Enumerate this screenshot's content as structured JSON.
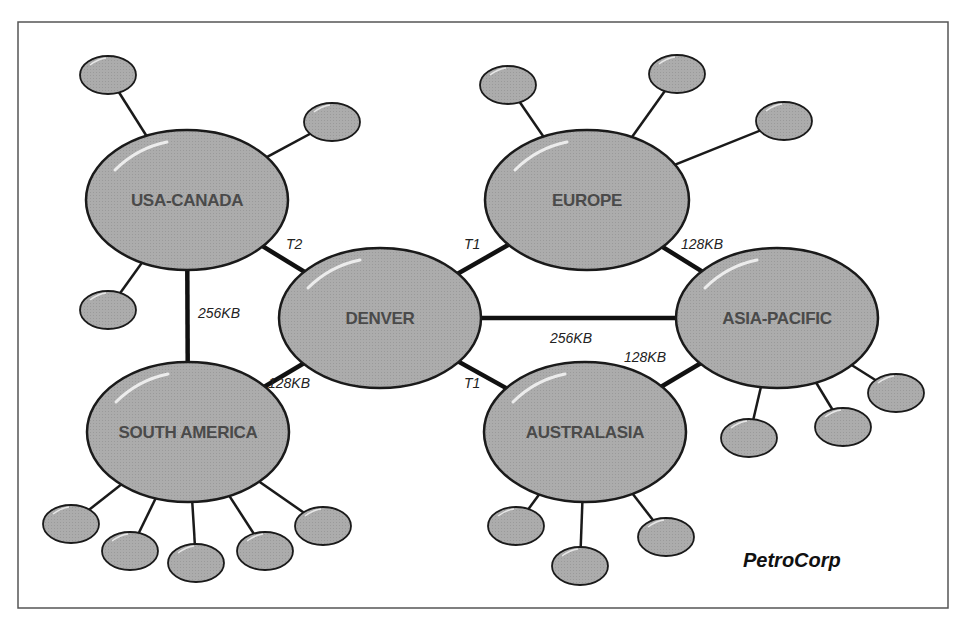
{
  "diagram": {
    "brand": "PetroCorp",
    "colors": {
      "node_fill": "#a9a9a9",
      "node_stroke": "#1a1a1a",
      "label_text": "#4a4a4a",
      "background": "#ffffff",
      "frame": "#555555"
    },
    "hubs": [
      {
        "id": "usa-canada",
        "label": "USA-CANADA",
        "cx": 187,
        "cy": 200,
        "rx": 101,
        "ry": 70
      },
      {
        "id": "denver",
        "label": "DENVER",
        "cx": 380,
        "cy": 318,
        "rx": 101,
        "ry": 70
      },
      {
        "id": "europe",
        "label": "EUROPE",
        "cx": 587,
        "cy": 200,
        "rx": 102,
        "ry": 70
      },
      {
        "id": "asia-pacific",
        "label": "ASIA-PACIFIC",
        "cx": 777,
        "cy": 318,
        "rx": 101,
        "ry": 70
      },
      {
        "id": "south-america",
        "label": "SOUTH AMERICA",
        "cx": 188,
        "cy": 432,
        "rx": 101,
        "ry": 70
      },
      {
        "id": "australasia",
        "label": "AUSTRALASIA",
        "cx": 585,
        "cy": 432,
        "rx": 101,
        "ry": 70
      }
    ],
    "links": [
      {
        "from": "usa-canada",
        "to": "denver",
        "label": "T2",
        "lx": 286,
        "ly": 249
      },
      {
        "from": "denver",
        "to": "europe",
        "label": "T1",
        "lx": 464,
        "ly": 249
      },
      {
        "from": "europe",
        "to": "asia-pacific",
        "label": "128KB",
        "lx": 681,
        "ly": 249
      },
      {
        "from": "usa-canada",
        "to": "south-america",
        "label": "256KB",
        "lx": 198,
        "ly": 318
      },
      {
        "from": "denver",
        "to": "asia-pacific",
        "label": "256KB",
        "lx": 550,
        "ly": 343
      },
      {
        "from": "denver",
        "to": "south-america",
        "label": "128KB",
        "lx": 268,
        "ly": 388
      },
      {
        "from": "denver",
        "to": "australasia",
        "label": "T1",
        "lx": 464,
        "ly": 388
      },
      {
        "from": "australasia",
        "to": "asia-pacific",
        "label": "128KB",
        "lx": 624,
        "ly": 362
      }
    ],
    "satellites": [
      {
        "hub": "usa-canada",
        "cx": 108,
        "cy": 75
      },
      {
        "hub": "usa-canada",
        "cx": 332,
        "cy": 122
      },
      {
        "hub": "usa-canada",
        "cx": 108,
        "cy": 310
      },
      {
        "hub": "europe",
        "cx": 508,
        "cy": 85
      },
      {
        "hub": "europe",
        "cx": 677,
        "cy": 74
      },
      {
        "hub": "europe",
        "cx": 784,
        "cy": 121
      },
      {
        "hub": "asia-pacific",
        "cx": 749,
        "cy": 438
      },
      {
        "hub": "asia-pacific",
        "cx": 843,
        "cy": 427
      },
      {
        "hub": "asia-pacific",
        "cx": 896,
        "cy": 393
      },
      {
        "hub": "south-america",
        "cx": 71,
        "cy": 524
      },
      {
        "hub": "south-america",
        "cx": 130,
        "cy": 551
      },
      {
        "hub": "south-america",
        "cx": 196,
        "cy": 563
      },
      {
        "hub": "south-america",
        "cx": 265,
        "cy": 551
      },
      {
        "hub": "south-america",
        "cx": 323,
        "cy": 526
      },
      {
        "hub": "australasia",
        "cx": 516,
        "cy": 526
      },
      {
        "hub": "australasia",
        "cx": 580,
        "cy": 566
      },
      {
        "hub": "australasia",
        "cx": 666,
        "cy": 537
      }
    ]
  }
}
